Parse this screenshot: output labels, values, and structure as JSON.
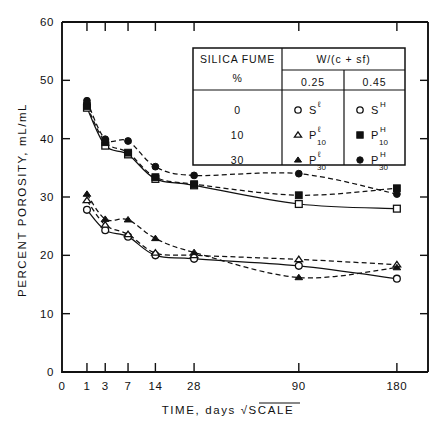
{
  "chart_data": {
    "type": "line",
    "title": "",
    "xlabel": "TIME, days  √SCALE",
    "ylabel": "PERCENT POROSITY, mL/mL",
    "xscale": "sqrt",
    "x_ticks": [
      0,
      1,
      3,
      7,
      14,
      28,
      90,
      180
    ],
    "x_tick_labels": [
      "0",
      "1",
      "3",
      "7",
      "14",
      "28",
      "90",
      "180"
    ],
    "xlim": [
      0,
      215
    ],
    "y_ticks": [
      0,
      10,
      20,
      30,
      40,
      50,
      60
    ],
    "y_tick_labels": [
      "0",
      "10",
      "20",
      "30",
      "40",
      "50",
      "60"
    ],
    "ylim": [
      0,
      60
    ],
    "grid": false,
    "legend_position": "inside-top-center",
    "x": [
      1,
      3,
      7,
      14,
      28,
      90,
      180
    ],
    "series": [
      {
        "name": "Sℓ",
        "label_base": "S",
        "label_sup": "ℓ",
        "label_sub": "",
        "marker": "circle",
        "filled": false,
        "line": "solid",
        "silica_fume_pct": "0",
        "w_cm_ratio": "0.25",
        "values": [
          27.8,
          24.3,
          23.2,
          20.0,
          19.4,
          18.2,
          16.0
        ]
      },
      {
        "name": "Pℓ 10",
        "label_base": "P",
        "label_sup": "ℓ",
        "label_sub": "10",
        "marker": "triangle",
        "filled": false,
        "line": "dashed",
        "silica_fume_pct": "10",
        "w_cm_ratio": "0.25",
        "values": [
          29.4,
          25.2,
          23.6,
          20.4,
          20.0,
          19.3,
          18.4
        ]
      },
      {
        "name": "Pℓ 30",
        "label_base": "P",
        "label_sup": "ℓ",
        "label_sub": "30",
        "marker": "triangle",
        "filled": true,
        "line": "dashed",
        "silica_fume_pct": "30",
        "w_cm_ratio": "0.25",
        "values": [
          30.5,
          26.2,
          26.1,
          22.9,
          20.5,
          16.2,
          17.9
        ]
      },
      {
        "name": "S H",
        "label_base": "S",
        "label_sup": "H",
        "label_sub": "",
        "marker": "square",
        "filled": false,
        "line": "solid",
        "silica_fume_pct": "0",
        "w_cm_ratio": "0.45",
        "values": [
          45.3,
          38.8,
          37.3,
          33.1,
          32.0,
          28.8,
          28.0
        ]
      },
      {
        "name": "P H 10",
        "label_base": "P",
        "label_sup": "H",
        "label_sub": "10",
        "marker": "square",
        "filled": true,
        "line": "dashed",
        "silica_fume_pct": "10",
        "w_cm_ratio": "0.45",
        "values": [
          45.6,
          39.4,
          37.6,
          33.4,
          32.2,
          30.3,
          31.5
        ]
      },
      {
        "name": "P H 30",
        "label_base": "P",
        "label_sup": "H",
        "label_sub": "30",
        "marker": "circle",
        "filled": true,
        "line": "dashed",
        "silica_fume_pct": "30",
        "w_cm_ratio": "0.45",
        "values": [
          46.5,
          39.9,
          39.6,
          35.2,
          33.7,
          34.0,
          30.5
        ]
      }
    ]
  },
  "legend": {
    "header_col1_line1": "SILICA FUME",
    "header_col1_line2": "%",
    "header_spanning": "W/(c + sf)",
    "header_col2": "0.25",
    "header_col3": "0.45",
    "rows": [
      {
        "pct": "0",
        "low": {
          "base": "S",
          "sup": "ℓ",
          "sub": "",
          "marker": "circle",
          "filled": false
        },
        "high": {
          "base": "S",
          "sup": "H",
          "sub": "",
          "marker": "circle",
          "filled": false
        }
      },
      {
        "pct": "10",
        "low": {
          "base": "P",
          "sup": "ℓ",
          "sub": "10",
          "marker": "triangle",
          "filled": false
        },
        "high": {
          "base": "P",
          "sup": "H",
          "sub": "10",
          "marker": "square",
          "filled": true
        }
      },
      {
        "pct": "30",
        "low": {
          "base": "P",
          "sup": "ℓ",
          "sub": "30",
          "marker": "triangle",
          "filled": true
        },
        "high": {
          "base": "P",
          "sup": "H",
          "sub": "30",
          "marker": "circle",
          "filled": true
        }
      }
    ]
  },
  "colors": {
    "ink": "#111111",
    "background": "#ffffff"
  }
}
